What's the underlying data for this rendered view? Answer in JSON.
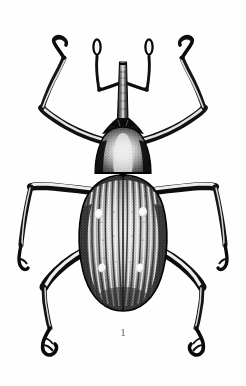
{
  "plate": {
    "figure_number": "1",
    "caption": "1",
    "background_color": "#fefefe",
    "ink_color": "#101010",
    "highlight_color": "#ffffff",
    "midtone_color": "#6d6d6d",
    "subject": "weevil-beetle",
    "style": "stipple-engraving",
    "width": 246,
    "height": 386
  },
  "specimen": {
    "name": "weevil",
    "orientation": "dorsal-view",
    "body_parts": {
      "rostrum": {
        "label": "rostrum",
        "cx": 123,
        "top_y": 62,
        "bottom_y": 128,
        "width": 7
      },
      "head": {
        "label": "head",
        "cx": 123,
        "cy": 131
      },
      "pronotum": {
        "label": "pronotum",
        "cx": 123,
        "cy": 152,
        "width": 52,
        "height": 46
      },
      "elytra": {
        "label": "elytra",
        "cx": 123,
        "cy": 238,
        "width": 80,
        "height": 140
      },
      "scutellum": {
        "label": "scutellum",
        "cx": 123,
        "cy": 176
      }
    },
    "elytra_striae_count": 16,
    "elytra_spots": [
      {
        "id": "spot-left-upper",
        "cx": 99,
        "cy": 214,
        "rx": 4.2,
        "ry": 5.0
      },
      {
        "id": "spot-right-upper",
        "cx": 143,
        "cy": 212,
        "rx": 4.2,
        "ry": 5.0
      },
      {
        "id": "spot-left-lower",
        "cx": 102,
        "cy": 268,
        "rx": 3.8,
        "ry": 4.6
      },
      {
        "id": "spot-right-lower",
        "cx": 140,
        "cy": 268,
        "rx": 3.8,
        "ry": 4.6
      }
    ],
    "antennae": [
      {
        "id": "antenna-left",
        "scape_from": [
          120,
          84
        ],
        "elbow": [
          99,
          88
        ],
        "club_at": [
          99,
          44
        ]
      },
      {
        "id": "antenna-right",
        "scape_from": [
          126,
          84
        ],
        "elbow": [
          147,
          88
        ],
        "club_at": [
          147,
          44
        ]
      }
    ],
    "legs": [
      {
        "id": "leg-fore-left",
        "position": "fore",
        "side": "left"
      },
      {
        "id": "leg-fore-right",
        "position": "fore",
        "side": "right"
      },
      {
        "id": "leg-mid-left",
        "position": "mid",
        "side": "left"
      },
      {
        "id": "leg-mid-right",
        "position": "mid",
        "side": "right"
      },
      {
        "id": "leg-hind-left",
        "position": "hind",
        "side": "left"
      },
      {
        "id": "leg-hind-right",
        "position": "hind",
        "side": "right"
      }
    ]
  }
}
